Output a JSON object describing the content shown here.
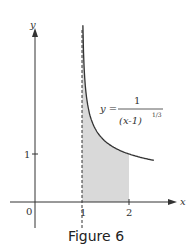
{
  "caption": "Figure 6",
  "colors": {
    "shade": "#d9d9d9",
    "curve": "#333333",
    "axis": "#333333"
  },
  "chart_data": {
    "type": "area",
    "title": "",
    "function": "y = 1/(x-1)^(1/3)",
    "equation_label": {
      "lhs": "y =",
      "numerator": "1",
      "denominator": "(x-1)",
      "exponent": "1/3"
    },
    "xlabel": "x",
    "ylabel": "y",
    "x_ticks": [
      "0",
      "1",
      "2"
    ],
    "y_ticks": [
      "1"
    ],
    "vertical_asymptote": 1,
    "shaded_region": {
      "x_from": 1,
      "x_to": 2,
      "description": "area under curve between x=1 and x=2"
    },
    "curve_x_range": [
      1.02,
      2.53
    ],
    "grid": false
  }
}
